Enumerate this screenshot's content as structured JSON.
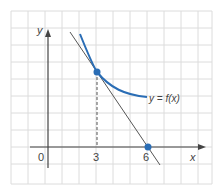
{
  "figure": {
    "axes": {
      "x_label": "x",
      "y_label": "y",
      "origin_label": "0"
    },
    "ticks": {
      "x3": "3",
      "x6": "6"
    },
    "curve_label": "y = f(x)",
    "colors": {
      "curve": "#2a6db5",
      "tangent": "#555555",
      "point": "#2a6db5",
      "grid": "#dcdcdc",
      "axis": "#444444"
    },
    "points": [
      {
        "name": "tangent-point",
        "x": 3,
        "y": 4.5
      },
      {
        "name": "x-intercept",
        "x": 6,
        "y": 0
      }
    ]
  }
}
